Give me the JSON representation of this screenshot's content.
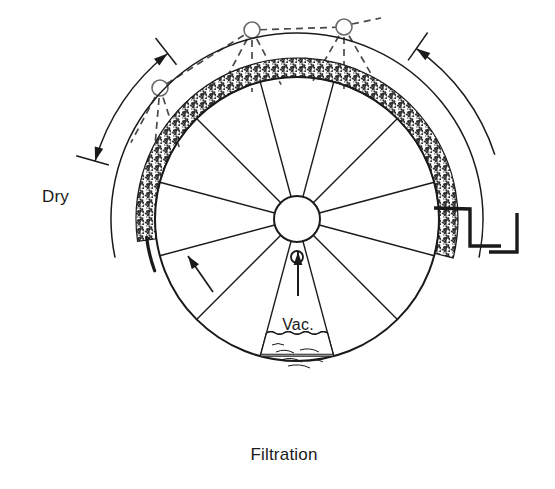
{
  "figure": {
    "background_color": "#ffffff",
    "line_color": "#1a1a1a",
    "dash_color": "#4a4a4a",
    "cake_fill_color": "#2b2b2b",
    "width": 555,
    "height": 489
  },
  "labels": {
    "dry": "Dry",
    "vacuum": "Vac.",
    "filtration": "Filtration"
  },
  "drum": {
    "center_x": 297,
    "center_y": 219,
    "outer_radius": 142,
    "hub_radius": 23,
    "spoke_count": 12,
    "vacuum_port_radius": 6,
    "vacuum_port_offset": 38
  },
  "cake": {
    "inner_radius": 142,
    "outer_radius": 161,
    "start_angle_deg": 172,
    "end_angle_deg": 374,
    "label": "filter-cake-layer"
  },
  "trough": {
    "radius": 186,
    "start_angle_deg": 168,
    "end_angle_deg": 372,
    "label": "slurry-trough-arc"
  },
  "sprays": {
    "count": 3,
    "nozzle_radius": 8,
    "nozzles": [
      {
        "id": "spray-nozzle-left",
        "cx": 160,
        "cy": 88,
        "jet_angles_deg": [
          72,
          95,
          118
        ]
      },
      {
        "id": "spray-nozzle-center",
        "cx": 252,
        "cy": 30,
        "jet_angles_deg": [
          62,
          90,
          118
        ]
      },
      {
        "id": "spray-nozzle-right",
        "cx": 344,
        "cy": 27,
        "jet_angles_deg": [
          60,
          90,
          120
        ]
      }
    ],
    "manifold_links": [
      {
        "from": 0,
        "to": 1
      },
      {
        "from": 1,
        "to": 2
      }
    ]
  },
  "dimension_dry": {
    "label": "Dry",
    "label_x": 42,
    "label_y": 202,
    "arc_radius": 210,
    "start_angle_deg": 196,
    "end_angle_deg": 232,
    "double_headed": true
  },
  "dimension_filtration": {
    "label": "Filtration",
    "label_x": 284,
    "label_y": 460,
    "right_arrow_radius": 208,
    "right_arrow_start_deg": 342,
    "right_arrow_end_deg": 305
  },
  "rotation_arrow": {
    "label": "rotation-direction-arrow",
    "x1": 213,
    "y1": 292,
    "x2": 188,
    "y2": 256
  },
  "vacuum_arrow": {
    "label": "vacuum-suction-arrow",
    "x1": 298,
    "y1": 296,
    "x2": 298,
    "y2": 252
  },
  "doctor_blade": {
    "label": "doctor-blade-scraper",
    "stroke_width": 3.4,
    "blade_points": "434,208 470,209 470,246 501,246",
    "chute_points": "517,213 517,252 489,252"
  },
  "liquid_cell": {
    "label": "slurry-filled-cell",
    "wave_amplitude": 2.6,
    "wave_count": 7
  }
}
